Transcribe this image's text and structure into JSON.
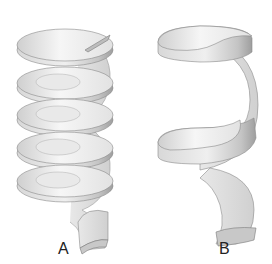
{
  "figure": {
    "panels": [
      {
        "label": "A",
        "turns": 5,
        "style": "thin flights, tight pitch"
      },
      {
        "label": "B",
        "turns": 2,
        "style": "thick ribbon, wide pitch"
      }
    ],
    "colors": {
      "surface_light": "#f4f4f4",
      "surface_mid": "#d6d6d6",
      "surface_dark": "#a8a8a8",
      "outline": "#8a8a8a"
    }
  }
}
